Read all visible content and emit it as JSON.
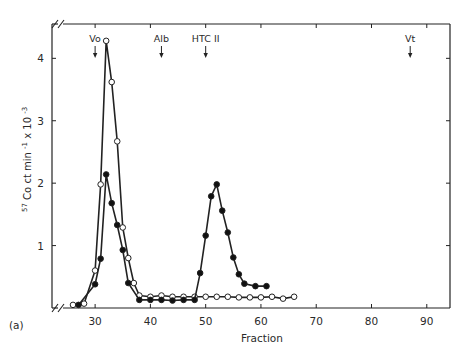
{
  "chart_data": {
    "type": "line",
    "panel_label": "(a)",
    "title": "",
    "xlabel": "Fraction",
    "ylabel": "57Co ct min-1 x 10-3",
    "ylabel_parts": {
      "iso": "57",
      "main": "Co  ct  min",
      "sup1": "-1",
      "mid": " x 10",
      "sup2": "-3"
    },
    "xlim": [
      22.2,
      94.2
    ],
    "ylim": [
      0,
      4.55
    ],
    "xticks": [
      30,
      40,
      50,
      60,
      70,
      80,
      90
    ],
    "yticks": [
      1,
      2,
      3,
      4
    ],
    "axis_break": true,
    "grid": false,
    "legend": "none",
    "markers_annotations": [
      {
        "label": "Vo",
        "x": 30
      },
      {
        "label": "Alb",
        "x": 42
      },
      {
        "label": "HTC II",
        "x": 50
      },
      {
        "label": "Vt",
        "x": 87
      }
    ],
    "series": [
      {
        "name": "open circles",
        "marker": "open",
        "x": [
          26,
          28,
          30,
          31,
          32,
          33,
          34,
          35,
          36,
          37,
          38,
          40,
          42,
          44,
          46,
          48,
          50,
          52,
          54,
          56,
          58,
          60,
          62,
          64,
          66
        ],
        "y": [
          0.05,
          0.07,
          0.6,
          1.98,
          4.28,
          3.62,
          2.67,
          1.29,
          0.8,
          0.4,
          0.2,
          0.18,
          0.2,
          0.18,
          0.18,
          0.18,
          0.18,
          0.18,
          0.18,
          0.17,
          0.17,
          0.17,
          0.18,
          0.15,
          0.18
        ]
      },
      {
        "name": "filled circles",
        "marker": "filled",
        "x": [
          27,
          30,
          31,
          32,
          33,
          34,
          35,
          36,
          38,
          40,
          42,
          44,
          46,
          48,
          49,
          50,
          51,
          52,
          53,
          54,
          55,
          56,
          57,
          59,
          61
        ],
        "y": [
          0.05,
          0.38,
          0.79,
          2.14,
          1.68,
          1.33,
          0.93,
          0.4,
          0.13,
          0.13,
          0.13,
          0.12,
          0.13,
          0.13,
          0.56,
          1.16,
          1.79,
          1.98,
          1.56,
          1.21,
          0.81,
          0.54,
          0.39,
          0.35,
          0.35
        ]
      }
    ]
  }
}
